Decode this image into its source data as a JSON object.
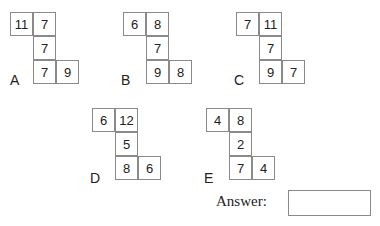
{
  "puzzles": [
    {
      "label": "A",
      "top_left": "11",
      "top_right": "7",
      "middle": "7",
      "bottom_left": "7",
      "bottom_right": "9"
    },
    {
      "label": "B",
      "top_left": "6",
      "top_right": "8",
      "middle": "7",
      "bottom_left": "9",
      "bottom_right": "8"
    },
    {
      "label": "C",
      "top_left": "7",
      "top_right": "11",
      "middle": "7",
      "bottom_left": "9",
      "bottom_right": "7"
    },
    {
      "label": "D",
      "top_left": "6",
      "top_right": "12",
      "middle": "5",
      "bottom_left": "8",
      "bottom_right": "6"
    },
    {
      "label": "E",
      "top_left": "4",
      "top_right": "8",
      "middle": "2",
      "bottom_left": "7",
      "bottom_right": "4"
    }
  ],
  "answer": {
    "label": "Answer:",
    "value": ""
  }
}
